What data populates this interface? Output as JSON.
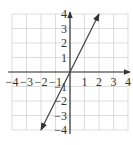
{
  "chart_data": {
    "type": "line",
    "title": "",
    "xlabel": "",
    "ylabel": "",
    "xlim": [
      -4,
      4
    ],
    "ylim": [
      -4,
      4
    ],
    "grid": true,
    "x_ticks": [
      "-4",
      "-3",
      "-2",
      "-1",
      "1",
      "2",
      "3",
      "4"
    ],
    "y_ticks": [
      "4",
      "3",
      "2",
      "1",
      "-1",
      "-2",
      "-3",
      "-4"
    ],
    "series": [
      {
        "name": "y = 2x",
        "x": [
          -2,
          2
        ],
        "y": [
          -4,
          4
        ],
        "arrows": "both"
      }
    ]
  },
  "colors": {
    "grid": "#d4d4d4",
    "axis": "#333333",
    "line": "#444444"
  }
}
